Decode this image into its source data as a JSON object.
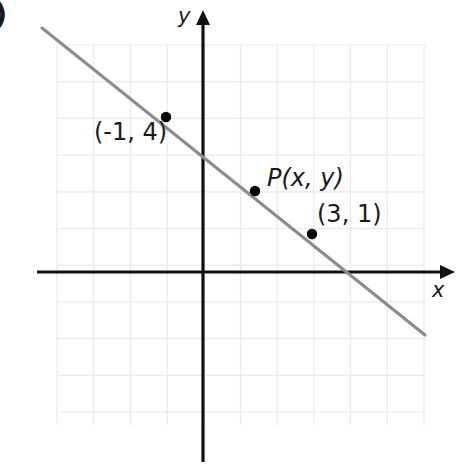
{
  "figure": {
    "part_label": ")",
    "width": 467,
    "height": 466
  },
  "axes": {
    "x_label": "x",
    "y_label": "y",
    "origin_px": {
      "x": 203,
      "y": 272
    },
    "unit_px": 36.7,
    "x_axis_y_px": 272,
    "y_axis_x_px": 203,
    "x_axis_from_px": 37,
    "x_axis_to_px": 455,
    "y_axis_from_px": 10,
    "y_axis_to_px": 462,
    "axis_color": "#111111",
    "arrowheads": [
      "x-positive",
      "y-positive"
    ]
  },
  "grid": {
    "left_px": 57,
    "top_px": 45,
    "right_px": 425,
    "bottom_px": 425,
    "spacing_px": 36.7,
    "columns": 10,
    "rows": 10,
    "color": "#e9e9e9",
    "visible": true
  },
  "chart_data": {
    "type": "scatter",
    "title": "",
    "xlabel": "x",
    "ylabel": "y",
    "xlim": [
      -4,
      6
    ],
    "ylim": [
      -4,
      6
    ],
    "grid": true,
    "legend": "none",
    "line": {
      "name": "line through (-1, 4) and (3, 1)",
      "color": "#8c8c8c",
      "slope": -0.75,
      "intercept": 3.25,
      "x_start": -4.4,
      "y_start": 6.65,
      "x_end": 6.05,
      "y_end": -1.72,
      "start_px": {
        "x": 42,
        "y": 28
      },
      "end_px": {
        "x": 425,
        "y": 335
      }
    },
    "points": [
      {
        "label": "(-1, 4)",
        "x": -1,
        "y": 4,
        "px": {
          "x": 166,
          "y": 117
        },
        "label_px": {
          "x": 94,
          "y": 120
        },
        "color": "#000000"
      },
      {
        "label": "P(x, y)",
        "x": null,
        "y": null,
        "px": {
          "x": 255,
          "y": 191
        },
        "label_px": {
          "x": 267,
          "y": 166
        },
        "color": "#000000"
      },
      {
        "label": "(3, 1)",
        "x": 3,
        "y": 1,
        "px": {
          "x": 312,
          "y": 234
        },
        "label_px": {
          "x": 317,
          "y": 202
        },
        "color": "#000000"
      }
    ]
  }
}
